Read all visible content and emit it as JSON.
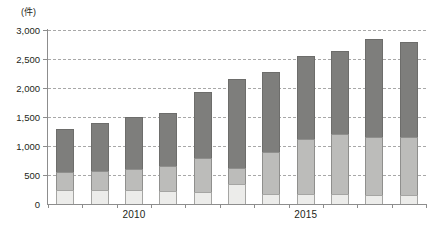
{
  "chart_data": {
    "type": "bar",
    "subtype": "stacked-bar",
    "title": "",
    "unit_label": "(件)",
    "xlabel": "",
    "ylabel": "",
    "ylim": [
      0,
      3000
    ],
    "ytick_values": [
      0,
      500,
      1000,
      1500,
      2000,
      2500,
      3000
    ],
    "ytick_labels": [
      "0",
      "500",
      "1,000",
      "1,500",
      "2,000",
      "2,500",
      "3,000"
    ],
    "grid": true,
    "grid_style": "dashed-horizontal",
    "legend": null,
    "categories": [
      "2008",
      "2009",
      "2010",
      "2011",
      "2012",
      "2013",
      "2014",
      "2015",
      "2016",
      "2017",
      "2018"
    ],
    "visible_xtick_labels": [
      "2010",
      "2015"
    ],
    "visible_xtick_index": [
      2,
      7
    ],
    "series": [
      {
        "name": "lower-segment",
        "color": "#ececea",
        "values": [
          240,
          240,
          240,
          220,
          210,
          340,
          180,
          170,
          170,
          150,
          160
        ]
      },
      {
        "name": "middle-segment",
        "color": "#bcbcba",
        "values": [
          310,
          330,
          360,
          430,
          590,
          280,
          720,
          950,
          1030,
          1010,
          1000
        ]
      },
      {
        "name": "upper-segment",
        "color": "#7e7e7c",
        "values": [
          750,
          830,
          900,
          920,
          1130,
          1530,
          1370,
          1440,
          1440,
          1680,
          1640
        ]
      }
    ],
    "cumulative_boundaries": {
      "lower_top": [
        240,
        240,
        240,
        220,
        210,
        340,
        180,
        170,
        170,
        150,
        160
      ],
      "middle_top": [
        550,
        570,
        600,
        650,
        800,
        620,
        900,
        1120,
        1200,
        1160,
        1160
      ],
      "totals": [
        1300,
        1400,
        1500,
        1570,
        1930,
        2150,
        2270,
        2560,
        2640,
        2840,
        2800
      ]
    }
  },
  "colors": {
    "axis": "#8d8d8d",
    "grid": "#9a9a9a",
    "text": "#231f20",
    "background": "#ffffff"
  }
}
